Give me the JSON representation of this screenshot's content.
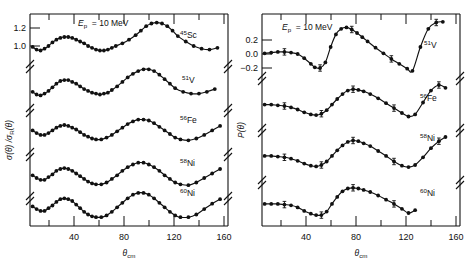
{
  "figure": {
    "title": "",
    "panels": [
      "left",
      "right"
    ]
  },
  "left_panel": {
    "annotation": "E",
    "annotation_sub": "p",
    "annotation_rest": "=  10 MeV",
    "ylabel_main": "σ(θ) /σ",
    "ylabel_sub": "R",
    "ylabel_tail": "(θ)",
    "xlabel_main": "θ",
    "xlabel_sub": "cm",
    "ytick_labels": [
      "1.2",
      "1.0"
    ],
    "xtick_labels": [
      "40",
      "80",
      "120",
      "160"
    ],
    "curve_labels": [
      {
        "sup": "45",
        "name": "Sc"
      },
      {
        "sup": "51",
        "name": "V"
      },
      {
        "sup": "56",
        "name": "Fe"
      },
      {
        "sup": "58",
        "name": "Ni"
      },
      {
        "sup": "60",
        "name": "Ni"
      }
    ]
  },
  "right_panel": {
    "annotation": "E",
    "annotation_sub": "p",
    "annotation_rest": "=  10 MeV",
    "ylabel_main": "P(θ)",
    "xlabel_main": "θ",
    "xlabel_sub": "cm",
    "ytick_labels": [
      "0.2",
      "0.0",
      "−0.2"
    ],
    "xtick_labels": [
      "40",
      "80",
      "120",
      "160"
    ],
    "curve_labels": [
      {
        "sup": "51",
        "name": "V"
      },
      {
        "sup": "56",
        "name": "Fe"
      },
      {
        "sup": "58",
        "name": "Ni"
      },
      {
        "sup": "60",
        "name": "Ni"
      }
    ]
  },
  "chart_data": {
    "type": "scatter",
    "title": "",
    "xlabel": "θ_cm (deg)",
    "ylabel_left": "σ(θ)/σ_R(θ)",
    "ylabel_right": "P(θ)",
    "xlim": [
      20,
      170
    ],
    "grid": false,
    "legend": "inline-right-of-curve",
    "annotation": "E_p = 10 MeV",
    "left_ylim_top_band": [
      0.9,
      1.3
    ],
    "left_yticks": [
      1.0,
      1.2
    ],
    "right_yticks": [
      -0.2,
      0.0,
      0.2
    ],
    "xticks": [
      40,
      80,
      120,
      160
    ],
    "left_series": [
      {
        "name": "45Sc",
        "x": [
          22,
          25,
          28,
          31,
          34,
          37,
          40,
          43,
          46,
          49,
          52,
          55,
          58,
          61,
          64,
          67,
          70,
          73,
          76,
          79,
          82,
          85,
          90,
          95,
          100,
          104,
          108,
          112,
          116,
          120,
          124,
          128,
          132,
          138,
          144,
          150,
          156,
          162
        ],
        "y": [
          0.99,
          0.96,
          0.95,
          0.97,
          1.0,
          1.04,
          1.07,
          1.09,
          1.1,
          1.1,
          1.09,
          1.07,
          1.05,
          1.03,
          1.0,
          0.98,
          0.96,
          0.95,
          0.95,
          0.96,
          0.98,
          1.0,
          1.03,
          1.07,
          1.12,
          1.17,
          1.22,
          1.25,
          1.26,
          1.25,
          1.22,
          1.17,
          1.11,
          1.05,
          1.0,
          0.97,
          0.96,
          0.98
        ]
      },
      {
        "name": "51V",
        "x": [
          22,
          25,
          28,
          31,
          34,
          37,
          40,
          43,
          46,
          49,
          52,
          55,
          58,
          61,
          64,
          67,
          70,
          73,
          76,
          79,
          82,
          86,
          90,
          94,
          98,
          102,
          106,
          110,
          114,
          118,
          122,
          126,
          130,
          136,
          142,
          148,
          154,
          160
        ],
        "y": [
          0.98,
          0.95,
          0.94,
          0.96,
          0.99,
          1.03,
          1.07,
          1.1,
          1.11,
          1.11,
          1.09,
          1.07,
          1.04,
          1.01,
          0.99,
          0.97,
          0.96,
          0.95,
          0.96,
          0.97,
          1.0,
          1.04,
          1.09,
          1.14,
          1.18,
          1.21,
          1.23,
          1.23,
          1.21,
          1.17,
          1.12,
          1.07,
          1.02,
          0.98,
          0.96,
          0.96,
          0.98,
          1.01
        ]
      },
      {
        "name": "56Fe",
        "x": [
          22,
          25,
          28,
          31,
          34,
          37,
          40,
          43,
          46,
          49,
          52,
          55,
          58,
          61,
          64,
          67,
          70,
          74,
          78,
          82,
          86,
          90,
          94,
          98,
          102,
          106,
          110,
          114,
          118,
          122,
          126,
          130,
          134,
          140,
          146,
          152,
          158,
          164
        ],
        "y": [
          1.04,
          1.01,
          0.99,
          0.99,
          1.01,
          1.04,
          1.07,
          1.09,
          1.1,
          1.09,
          1.07,
          1.05,
          1.02,
          0.99,
          0.97,
          0.95,
          0.94,
          0.94,
          0.96,
          0.99,
          1.03,
          1.07,
          1.11,
          1.14,
          1.16,
          1.16,
          1.15,
          1.12,
          1.08,
          1.04,
          1.0,
          0.96,
          0.94,
          0.93,
          0.95,
          0.99,
          1.04,
          1.09
        ]
      },
      {
        "name": "58Ni",
        "x": [
          22,
          25,
          28,
          31,
          34,
          37,
          40,
          43,
          46,
          49,
          52,
          55,
          58,
          61,
          64,
          67,
          70,
          74,
          78,
          82,
          86,
          90,
          94,
          98,
          102,
          106,
          110,
          114,
          118,
          122,
          126,
          130,
          134,
          140,
          146,
          152,
          158,
          164
        ],
        "y": [
          1.03,
          1.0,
          0.98,
          0.98,
          1.01,
          1.04,
          1.08,
          1.1,
          1.11,
          1.1,
          1.08,
          1.05,
          1.02,
          0.99,
          0.96,
          0.94,
          0.93,
          0.93,
          0.95,
          0.99,
          1.03,
          1.08,
          1.12,
          1.15,
          1.17,
          1.17,
          1.15,
          1.12,
          1.08,
          1.03,
          0.99,
          0.95,
          0.93,
          0.92,
          0.95,
          1.0,
          1.05,
          1.1
        ]
      },
      {
        "name": "60Ni",
        "x": [
          22,
          25,
          28,
          31,
          34,
          37,
          40,
          43,
          46,
          49,
          52,
          55,
          58,
          61,
          64,
          67,
          70,
          74,
          78,
          82,
          86,
          90,
          94,
          98,
          102,
          106,
          110,
          114,
          118,
          122,
          126,
          130,
          134,
          140,
          146,
          152,
          158,
          164
        ],
        "y": [
          1.04,
          1.01,
          0.99,
          0.99,
          1.02,
          1.05,
          1.09,
          1.12,
          1.13,
          1.12,
          1.1,
          1.06,
          1.02,
          0.98,
          0.95,
          0.93,
          0.92,
          0.92,
          0.94,
          0.98,
          1.03,
          1.08,
          1.13,
          1.17,
          1.19,
          1.19,
          1.17,
          1.13,
          1.08,
          1.03,
          0.98,
          0.94,
          0.92,
          0.92,
          0.95,
          1.01,
          1.07,
          1.12
        ]
      }
    ],
    "right_series": [
      {
        "name": "51V",
        "x": [
          22,
          27,
          32,
          37,
          42,
          47,
          52,
          57,
          60,
          64,
          68,
          72,
          76,
          80,
          84,
          88,
          92,
          96,
          100,
          106,
          112,
          118,
          124,
          130,
          134,
          140,
          146,
          152,
          157
        ],
        "y": [
          0.01,
          0.02,
          0.03,
          0.03,
          0.02,
          0.0,
          -0.06,
          -0.14,
          -0.19,
          -0.2,
          -0.12,
          0.1,
          0.28,
          0.36,
          0.38,
          0.35,
          0.3,
          0.24,
          0.18,
          0.09,
          0.01,
          -0.07,
          -0.14,
          -0.21,
          -0.24,
          0.1,
          0.36,
          0.45,
          0.46
        ]
      },
      {
        "name": "56Fe",
        "x": [
          22,
          27,
          32,
          37,
          42,
          47,
          52,
          57,
          61,
          65,
          69,
          73,
          77,
          81,
          85,
          89,
          93,
          97,
          102,
          108,
          114,
          120,
          126,
          131,
          136,
          142,
          148,
          154,
          159
        ],
        "y": [
          0.02,
          0.02,
          0.01,
          0.0,
          -0.02,
          -0.05,
          -0.09,
          -0.12,
          -0.13,
          -0.11,
          -0.06,
          0.02,
          0.1,
          0.17,
          0.22,
          0.24,
          0.23,
          0.21,
          0.17,
          0.11,
          0.04,
          -0.03,
          -0.1,
          -0.15,
          -0.12,
          0.05,
          0.22,
          0.3,
          0.26
        ]
      },
      {
        "name": "58Ni",
        "x": [
          22,
          27,
          32,
          37,
          42,
          47,
          52,
          57,
          61,
          65,
          69,
          73,
          77,
          81,
          85,
          89,
          93,
          97,
          102,
          108,
          114,
          120,
          126,
          131,
          136,
          142,
          148,
          154,
          159
        ],
        "y": [
          0.03,
          0.03,
          0.02,
          0.01,
          -0.01,
          -0.04,
          -0.08,
          -0.11,
          -0.12,
          -0.1,
          -0.05,
          0.03,
          0.11,
          0.18,
          0.23,
          0.25,
          0.24,
          0.21,
          0.17,
          0.1,
          0.03,
          -0.05,
          -0.11,
          -0.13,
          -0.1,
          0.01,
          0.14,
          0.24,
          0.3
        ]
      },
      {
        "name": "60Ni",
        "x": [
          22,
          27,
          32,
          37,
          42,
          47,
          52,
          57,
          61,
          65,
          69,
          73,
          77,
          81,
          85,
          89,
          93,
          97,
          102,
          108,
          114,
          120,
          126,
          131,
          136
        ],
        "y": [
          0.03,
          0.03,
          0.03,
          0.02,
          0.01,
          -0.02,
          -0.07,
          -0.11,
          -0.13,
          -0.13,
          -0.08,
          0.03,
          0.13,
          0.21,
          0.25,
          0.26,
          0.25,
          0.23,
          0.2,
          0.15,
          0.09,
          0.03,
          -0.04,
          -0.1,
          -0.06
        ]
      }
    ]
  }
}
